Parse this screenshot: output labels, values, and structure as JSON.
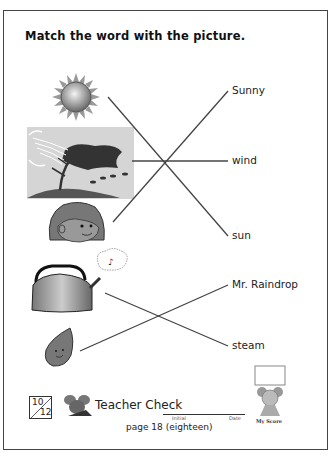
{
  "worksheet": {
    "title": "Match the word with the picture.",
    "pictures": [
      {
        "name": "sun-picture",
        "y": 97
      },
      {
        "name": "wind-picture",
        "y": 161
      },
      {
        "name": "girl-picture",
        "y": 222
      },
      {
        "name": "kettle-picture",
        "y": 293
      },
      {
        "name": "raindrop-picture",
        "y": 351
      }
    ],
    "words": [
      {
        "label": "Sunny",
        "y": 91
      },
      {
        "label": "wind",
        "y": 161
      },
      {
        "label": "sun",
        "y": 236
      },
      {
        "label": "Mr. Raindrop",
        "y": 285
      },
      {
        "label": "steam",
        "y": 346
      }
    ],
    "matches": [
      {
        "picture": "sun",
        "word": "sun"
      },
      {
        "picture": "wind",
        "word": "wind"
      },
      {
        "picture": "girl",
        "word": "Sunny"
      },
      {
        "picture": "kettle",
        "word": "steam"
      },
      {
        "picture": "raindrop",
        "word": "Mr. Raindrop"
      }
    ]
  },
  "footer": {
    "score_numerator": "10",
    "score_denominator": "12",
    "teacher_check": "Teacher Check",
    "initial_label": "Initial",
    "date_label": "Date",
    "page_label": "page 18 (eighteen)",
    "my_score_label": "My Score"
  }
}
